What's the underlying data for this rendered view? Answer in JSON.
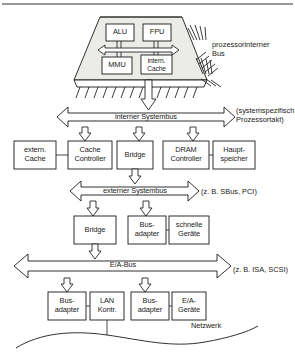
{
  "diagram": {
    "chip": {
      "label_bus": "prozessorinterner\nBus",
      "units": [
        {
          "id": "alu",
          "label": "ALU"
        },
        {
          "id": "fpu",
          "label": "FPU"
        },
        {
          "id": "mmu",
          "label": "MMU"
        },
        {
          "id": "cache",
          "label": "intern.\nCache"
        }
      ]
    },
    "buses": [
      {
        "id": "internal-system-bus",
        "label": "interner Systembus",
        "note": "(systemspezifisch,\nProzessortakt)"
      },
      {
        "id": "external-system-bus",
        "label": "externer Systembus",
        "note": "(z. B. SBus, PCI)"
      },
      {
        "id": "io-bus",
        "label": "E/A-Bus",
        "note": "(z. B. ISA, SCSI)"
      }
    ],
    "row_internal": [
      {
        "id": "extern-cache",
        "label": "extern.\nCache"
      },
      {
        "id": "cache-controller",
        "label": "Cache\nController"
      },
      {
        "id": "bridge-1",
        "label": "Bridge"
      },
      {
        "id": "dram-controller",
        "label": "DRAM\nController"
      },
      {
        "id": "hauptspeicher",
        "label": "Haupt-\nspeicher"
      }
    ],
    "row_external": [
      {
        "id": "bridge-2",
        "label": "Bridge"
      },
      {
        "id": "busadapter-1",
        "label": "Bus-\nadapter"
      },
      {
        "id": "schnelle-geraete",
        "label": "schnelle\nGeräte"
      }
    ],
    "row_io": [
      {
        "id": "busadapter-2",
        "label": "Bus-\nadapter"
      },
      {
        "id": "lan-kontroller",
        "label": "LAN\nKontr."
      },
      {
        "id": "busadapter-3",
        "label": "Bus-\nadapter"
      },
      {
        "id": "ea-geraete",
        "label": "E/A-\nGeräte"
      }
    ],
    "network": {
      "id": "netzwerk",
      "label": "Netzwerk"
    },
    "colors": {
      "stroke": "#1a1a1a",
      "fill": "#ffffff",
      "chip_fill": "#f2f2f0",
      "text": "#1a1a1a"
    }
  }
}
